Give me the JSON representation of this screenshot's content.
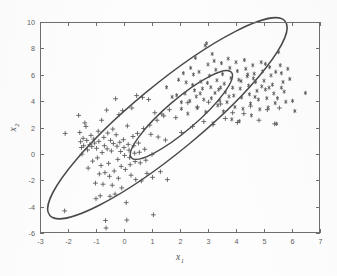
{
  "page": {
    "header_fragment": "模式识别（第三版）",
    "background_color": "#fdfdfd"
  },
  "figure": {
    "name": "two-class-scatter-with-confidence-ellipses",
    "plot_box": {
      "left": 40,
      "top": 22,
      "right": 320,
      "bottom": 233
    },
    "axis_color": "#6f6f6f",
    "curve_color": "#4a4a4a",
    "marker_color": "#555555"
  },
  "chart_data": {
    "type": "scatter",
    "title": "",
    "xlabel": "x",
    "xlabel_sub": "1",
    "ylabel": "x",
    "ylabel_sub": "2",
    "xlim": [
      -3,
      7
    ],
    "ylim": [
      -6,
      10
    ],
    "xticks": [
      -3,
      -2,
      -1,
      0,
      1,
      2,
      3,
      4,
      5,
      6,
      7
    ],
    "yticks": [
      -6,
      -4,
      -2,
      0,
      2,
      4,
      6,
      8,
      10
    ],
    "xtick_labels": [
      "-3",
      "-2",
      "-1",
      "0",
      "1",
      "2",
      "3",
      "4",
      "5",
      "6",
      "7"
    ],
    "ytick_labels": [
      "-6",
      "-4",
      "-2",
      "0",
      "2",
      "4",
      "6",
      "8",
      "10"
    ],
    "grid": false,
    "legend": null,
    "series": [
      {
        "name": "class-1",
        "marker": "plus",
        "color": "#555555",
        "points": [
          [
            -2.12,
            -4.32
          ],
          [
            -2.1,
            1.55
          ],
          [
            -1.62,
            2.92
          ],
          [
            -1.58,
            1.62
          ],
          [
            -1.55,
            0.92
          ],
          [
            -1.52,
            0.48
          ],
          [
            -1.5,
            -0.02
          ],
          [
            -1.46,
            1.18
          ],
          [
            -1.44,
            0.62
          ],
          [
            -1.4,
            2.35
          ],
          [
            -1.36,
            2.08
          ],
          [
            -1.33,
            1.02
          ],
          [
            -1.3,
            0.3
          ],
          [
            -1.28,
            -1.08
          ],
          [
            -1.22,
            0.7
          ],
          [
            -1.18,
            1.4
          ],
          [
            -1.15,
            0.55
          ],
          [
            -1.12,
            -0.55
          ],
          [
            -1.08,
            1.12
          ],
          [
            -1.05,
            0.82
          ],
          [
            -1.02,
            -2.22
          ],
          [
            -1.0,
            -3.4
          ],
          [
            -0.98,
            0.42
          ],
          [
            -0.95,
            -0.3
          ],
          [
            -0.92,
            1.72
          ],
          [
            -0.9,
            0.95
          ],
          [
            -0.88,
            -1.52
          ],
          [
            -0.85,
            -3.18
          ],
          [
            -0.82,
            -0.88
          ],
          [
            -0.8,
            2.55
          ],
          [
            -0.78,
            0.1
          ],
          [
            -0.75,
            -2.3
          ],
          [
            -0.72,
            1.25
          ],
          [
            -0.7,
            0.62
          ],
          [
            -0.68,
            -1.42
          ],
          [
            -0.66,
            -5.05
          ],
          [
            -0.64,
            -5.62
          ],
          [
            -0.62,
            3.32
          ],
          [
            -0.6,
            0.38
          ],
          [
            -0.58,
            1.58
          ],
          [
            -0.55,
            -0.72
          ],
          [
            -0.52,
            -1.7
          ],
          [
            -0.5,
            -3.22
          ],
          [
            -0.48,
            1.02
          ],
          [
            -0.45,
            0.22
          ],
          [
            -0.42,
            -2.38
          ],
          [
            -0.4,
            1.88
          ],
          [
            -0.38,
            0.78
          ],
          [
            -0.35,
            -1.3
          ],
          [
            -0.32,
            -3.05
          ],
          [
            -0.3,
            4.18
          ],
          [
            -0.28,
            1.45
          ],
          [
            -0.25,
            0.58
          ],
          [
            -0.22,
            -0.42
          ],
          [
            -0.2,
            -1.85
          ],
          [
            -0.18,
            2.98
          ],
          [
            -0.15,
            0.88
          ],
          [
            -0.12,
            0.18
          ],
          [
            -0.1,
            -0.95
          ],
          [
            -0.08,
            -2.58
          ],
          [
            -0.05,
            3.28
          ],
          [
            -0.02,
            1.08
          ],
          [
            0.0,
            0.48
          ],
          [
            0.02,
            -0.12
          ],
          [
            0.05,
            -1.18
          ],
          [
            0.08,
            -3.7
          ],
          [
            0.1,
            -5.02
          ],
          [
            0.12,
            2.12
          ],
          [
            0.15,
            0.72
          ],
          [
            0.18,
            0.28
          ],
          [
            0.2,
            -0.28
          ],
          [
            0.22,
            -0.82
          ],
          [
            0.25,
            -1.62
          ],
          [
            0.28,
            3.48
          ],
          [
            0.32,
            1.32
          ],
          [
            0.35,
            0.62
          ],
          [
            0.38,
            0.05
          ],
          [
            0.4,
            -0.58
          ],
          [
            0.42,
            -1.95
          ],
          [
            0.45,
            4.42
          ],
          [
            0.48,
            1.55
          ],
          [
            0.52,
            0.82
          ],
          [
            0.55,
            0.12
          ],
          [
            0.58,
            -0.68
          ],
          [
            0.62,
            -2.05
          ],
          [
            0.66,
            4.28
          ],
          [
            0.7,
            1.92
          ],
          [
            0.74,
            0.35
          ],
          [
            0.78,
            -0.48
          ],
          [
            0.82,
            -1.48
          ],
          [
            0.88,
            4.12
          ],
          [
            0.92,
            2.18
          ],
          [
            0.96,
            1.48
          ],
          [
            1.0,
            -0.05
          ],
          [
            1.02,
            -1.78
          ],
          [
            1.05,
            -4.62
          ],
          [
            1.1,
            3.12
          ],
          [
            1.18,
            2.55
          ],
          [
            1.22,
            1.28
          ],
          [
            1.3,
            -1.35
          ],
          [
            1.35,
            3.02
          ],
          [
            1.42,
            2.88
          ],
          [
            1.48,
            1.05
          ],
          [
            1.55,
            -1.95
          ],
          [
            1.62,
            3.35
          ],
          [
            1.85,
            2.75
          ],
          [
            2.05,
            1.62
          ],
          [
            2.28,
            3.88
          ],
          [
            2.45,
            2.08
          ],
          [
            2.62,
            3.55
          ],
          [
            2.85,
            2.45
          ],
          [
            3.02,
            3.92
          ],
          [
            3.18,
            2.22
          ],
          [
            3.45,
            3.78
          ],
          [
            3.62,
            2.68
          ],
          [
            3.88,
            3.12
          ],
          [
            4.05,
            2.38
          ],
          [
            4.28,
            3.05
          ],
          [
            4.52,
            3.62
          ],
          [
            4.82,
            2.55
          ],
          [
            5.12,
            3.35
          ],
          [
            5.38,
            2.28
          ],
          [
            5.55,
            3.48
          ]
        ]
      },
      {
        "name": "class-2",
        "marker": "asterisk",
        "color": "#555555",
        "points": [
          [
            1.52,
            5.05
          ],
          [
            1.72,
            4.32
          ],
          [
            1.88,
            4.45
          ],
          [
            2.05,
            3.92
          ],
          [
            2.18,
            4.58
          ],
          [
            2.28,
            3.05
          ],
          [
            2.38,
            6.52
          ],
          [
            2.45,
            5.22
          ],
          [
            2.52,
            4.82
          ],
          [
            2.58,
            4.35
          ],
          [
            2.62,
            3.48
          ],
          [
            2.68,
            6.22
          ],
          [
            2.75,
            5.48
          ],
          [
            2.8,
            4.95
          ],
          [
            2.85,
            4.12
          ],
          [
            2.9,
            8.22
          ],
          [
            2.95,
            8.38
          ],
          [
            3.0,
            6.78
          ],
          [
            3.05,
            5.92
          ],
          [
            3.1,
            5.05
          ],
          [
            3.12,
            4.22
          ],
          [
            3.18,
            2.32
          ],
          [
            3.22,
            7.05
          ],
          [
            3.28,
            6.38
          ],
          [
            3.32,
            5.58
          ],
          [
            3.38,
            4.88
          ],
          [
            3.42,
            4.05
          ],
          [
            3.48,
            6.88
          ],
          [
            3.52,
            6.05
          ],
          [
            3.58,
            5.32
          ],
          [
            3.62,
            4.68
          ],
          [
            3.68,
            3.92
          ],
          [
            3.72,
            7.22
          ],
          [
            3.78,
            6.52
          ],
          [
            3.82,
            5.75
          ],
          [
            3.88,
            5.02
          ],
          [
            3.92,
            4.42
          ],
          [
            3.96,
            3.55
          ],
          [
            4.0,
            6.95
          ],
          [
            4.05,
            6.28
          ],
          [
            4.1,
            5.62
          ],
          [
            4.15,
            4.95
          ],
          [
            4.2,
            4.28
          ],
          [
            4.25,
            3.42
          ],
          [
            4.3,
            7.12
          ],
          [
            4.35,
            6.45
          ],
          [
            4.4,
            5.88
          ],
          [
            4.45,
            5.18
          ],
          [
            4.48,
            4.52
          ],
          [
            4.52,
            3.82
          ],
          [
            4.55,
            2.92
          ],
          [
            4.6,
            6.72
          ],
          [
            4.65,
            6.08
          ],
          [
            4.7,
            5.45
          ],
          [
            4.75,
            4.78
          ],
          [
            4.8,
            4.12
          ],
          [
            4.85,
            3.38
          ],
          [
            4.9,
            6.95
          ],
          [
            4.95,
            6.25
          ],
          [
            5.0,
            5.55
          ],
          [
            5.05,
            4.88
          ],
          [
            5.1,
            4.22
          ],
          [
            5.15,
            3.52
          ],
          [
            5.2,
            6.58
          ],
          [
            5.25,
            5.95
          ],
          [
            5.3,
            5.25
          ],
          [
            5.35,
            4.58
          ],
          [
            5.4,
            3.85
          ],
          [
            5.45,
            2.28
          ],
          [
            5.52,
            7.72
          ],
          [
            5.58,
            6.72
          ],
          [
            5.62,
            6.12
          ],
          [
            5.68,
            5.45
          ],
          [
            5.72,
            4.72
          ],
          [
            5.78,
            3.95
          ],
          [
            5.85,
            6.45
          ],
          [
            5.92,
            5.68
          ],
          [
            6.02,
            4.02
          ],
          [
            6.1,
            3.25
          ],
          [
            6.48,
            4.62
          ],
          [
            2.22,
            5.42
          ],
          [
            2.48,
            6.02
          ],
          [
            2.72,
            4.58
          ],
          [
            2.98,
            5.38
          ],
          [
            3.25,
            4.62
          ],
          [
            3.55,
            3.22
          ],
          [
            3.85,
            2.62
          ],
          [
            4.12,
            2.48
          ],
          [
            1.95,
            5.62
          ],
          [
            2.12,
            6.12
          ],
          [
            2.35,
            4.02
          ],
          [
            2.55,
            7.28
          ],
          [
            3.15,
            7.58
          ],
          [
            3.45,
            5.02
          ],
          [
            3.75,
            4.35
          ],
          [
            4.18,
            5.52
          ],
          [
            4.42,
            6.02
          ],
          [
            4.68,
            4.32
          ],
          [
            4.92,
            5.12
          ],
          [
            5.18,
            5.02
          ],
          [
            5.42,
            6.22
          ],
          [
            5.62,
            5.02
          ],
          [
            2.05,
            3.42
          ],
          [
            2.92,
            3.18
          ],
          [
            3.35,
            3.68
          ],
          [
            4.62,
            5.72
          ],
          [
            5.05,
            6.82
          ],
          [
            5.48,
            4.22
          ]
        ]
      }
    ],
    "ellipses": [
      {
        "name": "inner-confidence-ellipse",
        "cx": 2.05,
        "cy": 2.95,
        "rx": 2.35,
        "ry": 1.18,
        "rotation_deg": -40.5
      },
      {
        "name": "outer-confidence-ellipse",
        "cx": 1.55,
        "cy": 2.7,
        "rx": 5.45,
        "ry": 2.55,
        "rotation_deg": -39.5
      }
    ]
  }
}
